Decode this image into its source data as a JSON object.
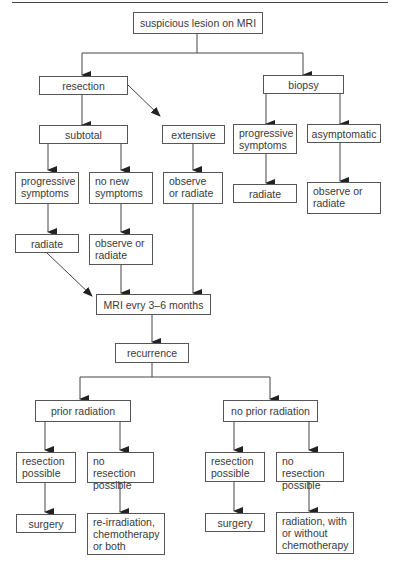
{
  "diagram": {
    "type": "flowchart",
    "nodes": {
      "suspicious_lesion": "suspicious lesion on MRI",
      "resection": "resection",
      "biopsy": "biopsy",
      "subtotal": "subtotal",
      "extensive": "extensive",
      "resection_progressive": "progressive symptoms",
      "no_new_symptoms": "no new symptoms",
      "extensive_observe": "observe or radiate",
      "biopsy_progressive": "progressive symptoms",
      "asymptomatic": "asymptomatic",
      "radiate_left": "radiate",
      "observe_or_radiate_mid": "observe or radiate",
      "biopsy_radiate": "radiate",
      "biopsy_observe": "observe or radiate",
      "mri_followup": "MRI evry 3–6 months",
      "recurrence": "recurrence",
      "prior_radiation": "prior radiation",
      "no_prior_radiation": "no prior radiation",
      "pr_resection_possible": "resection possible",
      "pr_no_resection": "no resection possible",
      "npr_resection_possible": "resection possible",
      "npr_no_resection": "no resection possible",
      "pr_surgery": "surgery",
      "pr_reirradiation": "re-irradiation, chemotherapy or both",
      "npr_surgery": "surgery",
      "npr_radiation": "radiation, with or without chemotherapy"
    },
    "edges": [
      [
        "suspicious_lesion",
        "resection"
      ],
      [
        "suspicious_lesion",
        "biopsy"
      ],
      [
        "resection",
        "subtotal"
      ],
      [
        "resection",
        "extensive"
      ],
      [
        "subtotal",
        "resection_progressive"
      ],
      [
        "subtotal",
        "no_new_symptoms"
      ],
      [
        "extensive",
        "extensive_observe"
      ],
      [
        "biopsy",
        "biopsy_progressive"
      ],
      [
        "biopsy",
        "asymptomatic"
      ],
      [
        "resection_progressive",
        "radiate_left"
      ],
      [
        "no_new_symptoms",
        "observe_or_radiate_mid"
      ],
      [
        "biopsy_progressive",
        "biopsy_radiate"
      ],
      [
        "asymptomatic",
        "biopsy_observe"
      ],
      [
        "radiate_left",
        "mri_followup"
      ],
      [
        "observe_or_radiate_mid",
        "mri_followup"
      ],
      [
        "extensive_observe",
        "mri_followup"
      ],
      [
        "mri_followup",
        "recurrence"
      ],
      [
        "recurrence",
        "prior_radiation"
      ],
      [
        "recurrence",
        "no_prior_radiation"
      ],
      [
        "prior_radiation",
        "pr_resection_possible"
      ],
      [
        "prior_radiation",
        "pr_no_resection"
      ],
      [
        "no_prior_radiation",
        "npr_resection_possible"
      ],
      [
        "no_prior_radiation",
        "npr_no_resection"
      ],
      [
        "pr_resection_possible",
        "pr_surgery"
      ],
      [
        "pr_no_resection",
        "pr_reirradiation"
      ],
      [
        "npr_resection_possible",
        "npr_surgery"
      ],
      [
        "npr_no_resection",
        "npr_radiation"
      ]
    ]
  }
}
